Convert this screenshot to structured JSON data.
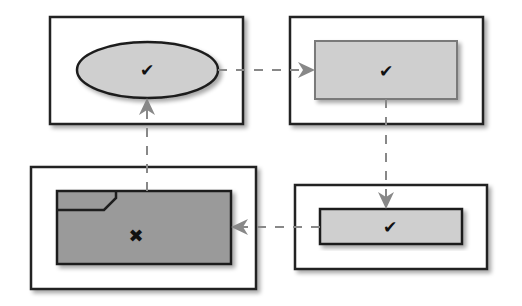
{
  "diagram": {
    "type": "state-flow",
    "colors": {
      "background": "#ffffff",
      "frame_stroke": "#222222",
      "shape_stroke_dark": "#1e1e1e",
      "shape_stroke_mid": "#7a7a7a",
      "fill_light": "#cfcfcf",
      "fill_dark": "#9a9a9a",
      "connector": "#888888",
      "mark": "#111111"
    },
    "nodes": [
      {
        "id": "start",
        "shape": "ellipse",
        "status": "check",
        "status_glyph": "✔",
        "position": "top-left"
      },
      {
        "id": "step-2",
        "shape": "rectangle",
        "status": "check",
        "status_glyph": "✔",
        "position": "top-right"
      },
      {
        "id": "step-3",
        "shape": "rectangle-thin",
        "status": "check",
        "status_glyph": "✔",
        "position": "bottom-right"
      },
      {
        "id": "failed",
        "shape": "folder-rectangle",
        "status": "cross",
        "status_glyph": "✖",
        "position": "bottom-left"
      }
    ],
    "edges": [
      {
        "from": "start",
        "to": "step-2",
        "style": "dashed",
        "direction": "right"
      },
      {
        "from": "step-2",
        "to": "step-3",
        "style": "dashed",
        "direction": "down"
      },
      {
        "from": "step-3",
        "to": "failed",
        "style": "dashed",
        "direction": "left"
      },
      {
        "from": "failed",
        "to": "start",
        "style": "dashed",
        "direction": "up"
      }
    ]
  }
}
